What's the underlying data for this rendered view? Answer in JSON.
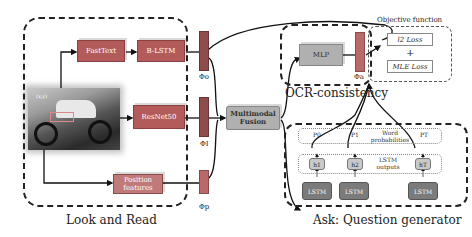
{
  "figure": {
    "sections": {
      "look_and_read": "Look and Read",
      "ocr_consistency": "OCR-consistency",
      "ask": "Ask: Question generator",
      "objective": "Objective function"
    },
    "blocks": {
      "fasttext": "FastText",
      "blstm": "B-LSTM",
      "resnet": "ResNet50",
      "position": "Position features",
      "fusion": "Multimodal Fusion",
      "mlp": "MLP"
    },
    "features": {
      "phi_o": "Φo",
      "phi_i": "ΦI",
      "phi_p": "Φp",
      "phi_a": "Φa"
    },
    "losses": {
      "l2": "l2 Loss",
      "plus": "+",
      "mle": "MLE Loss"
    },
    "decoder": {
      "word_probs_label": "Word probabilities",
      "lstm_outputs_label": "LSTM outputs",
      "probs": [
        "P0",
        "P1",
        "PT"
      ],
      "hidden": [
        "h1",
        "h2",
        "hT"
      ],
      "lstm_cells": [
        "LSTM",
        "LSTM",
        "LSTM"
      ]
    },
    "image": {
      "bbox_label": "(x,y)"
    }
  },
  "colors": {
    "block_red": "#b35b5b",
    "feature_bar": "#8f4c4c",
    "fusion_grey": "#b0b0b0",
    "lstm_grey": "#7b7b7b",
    "hidden_grey": "#c9c9c9"
  }
}
